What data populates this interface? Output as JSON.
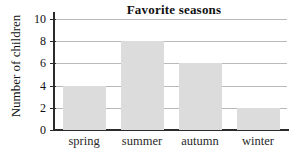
{
  "chart_data": {
    "type": "bar",
    "title": "Favorite seasons",
    "xlabel": "",
    "ylabel": "Number of children",
    "categories": [
      "spring",
      "summer",
      "autumn",
      "winter"
    ],
    "values": [
      4,
      8,
      6,
      2
    ],
    "ylim": [
      0,
      10
    ],
    "ytick_labels": [
      "0",
      "2",
      "4",
      "6",
      "8",
      "10"
    ],
    "ytick_values": [
      0,
      2,
      4,
      6,
      8,
      10
    ],
    "grid": "horizontal",
    "legend": "none",
    "colors": {
      "bar_fill": "#dcdcdc",
      "gridline": "#b9b9b9",
      "axis": "#2b2b2b",
      "text": "#111111",
      "background": "#ffffff"
    }
  }
}
